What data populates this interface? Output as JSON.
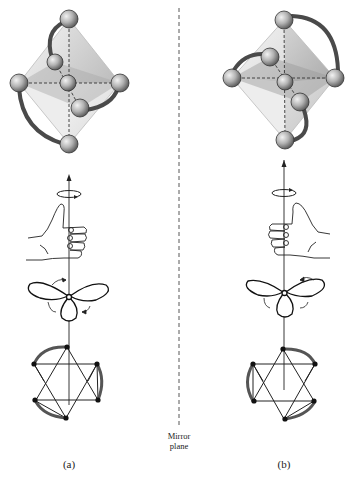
{
  "figure": {
    "panels": [
      {
        "id": "a",
        "label": "(a)",
        "description": "Left-handed (Λ) chelate octahedral complex"
      },
      {
        "id": "b",
        "label": "(b)",
        "description": "Right-handed (Δ) chelate octahedral complex"
      }
    ],
    "mirror": {
      "label_line1": "Mirror",
      "label_line2": "plane"
    },
    "icons": {
      "octahedron": "octahedron-complex-icon",
      "hand": "thumb-hand-icon",
      "propeller": "propeller-icon",
      "projection": "triangle-projection-icon",
      "rotation": "rotation-arrow-icon"
    },
    "colors": {
      "line": "#222222",
      "ligand_arc": "#555555",
      "sphere": "#9a9a9a",
      "face_light": "#dcdcdc",
      "face_dark": "#9b9b9b"
    }
  }
}
